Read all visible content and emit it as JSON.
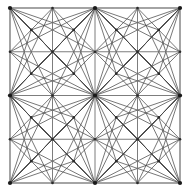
{
  "figure": {
    "type": "mesh-diagram",
    "width": 188,
    "height": 191,
    "background_color": "#ffffff"
  },
  "style": {
    "grid_color": "#6e6e6e",
    "border_color": "#5a5a5a",
    "diagonal_color": "#4a4a4a",
    "node_major_color": "#1a1a1a",
    "node_minor_color": "#2b2b2b",
    "grid_stroke_width": 0.9,
    "border_stroke_width": 1.1,
    "diagonal_stroke_width": 0.75,
    "node_major_radius": 2.1,
    "node_minor_radius": 1.3
  },
  "mesh_data": {
    "domain": {
      "x_min": 10,
      "x_max": 180,
      "y_min": 8,
      "y_max": 183
    },
    "grid_x": [
      10,
      52.5,
      95,
      137.5,
      180
    ],
    "grid_y": [
      8,
      51.75,
      95.5,
      139.25,
      183
    ],
    "quadrant_count": 4,
    "cells_per_side": 4,
    "hub_nodes": [
      {
        "x": 10,
        "y": 8
      },
      {
        "x": 95,
        "y": 8
      },
      {
        "x": 180,
        "y": 8
      },
      {
        "x": 10,
        "y": 95.5
      },
      {
        "x": 95,
        "y": 95.5
      },
      {
        "x": 180,
        "y": 95.5
      },
      {
        "x": 10,
        "y": 183
      },
      {
        "x": 95,
        "y": 183
      },
      {
        "x": 180,
        "y": 183
      }
    ],
    "minor_nodes": [
      {
        "x": 52.5,
        "y": 8
      },
      {
        "x": 137.5,
        "y": 8
      },
      {
        "x": 10,
        "y": 51.75
      },
      {
        "x": 52.5,
        "y": 51.75
      },
      {
        "x": 95,
        "y": 51.75
      },
      {
        "x": 137.5,
        "y": 51.75
      },
      {
        "x": 180,
        "y": 51.75
      },
      {
        "x": 52.5,
        "y": 95.5
      },
      {
        "x": 137.5,
        "y": 95.5
      },
      {
        "x": 10,
        "y": 139.25
      },
      {
        "x": 52.5,
        "y": 139.25
      },
      {
        "x": 95,
        "y": 139.25
      },
      {
        "x": 137.5,
        "y": 139.25
      },
      {
        "x": 180,
        "y": 139.25
      },
      {
        "x": 52.5,
        "y": 183
      },
      {
        "x": 137.5,
        "y": 183
      },
      {
        "x": 31.25,
        "y": 29.875
      },
      {
        "x": 73.75,
        "y": 29.875
      },
      {
        "x": 116.25,
        "y": 29.875
      },
      {
        "x": 158.75,
        "y": 29.875
      },
      {
        "x": 31.25,
        "y": 73.625
      },
      {
        "x": 73.75,
        "y": 73.625
      },
      {
        "x": 116.25,
        "y": 73.625
      },
      {
        "x": 158.75,
        "y": 73.625
      },
      {
        "x": 31.25,
        "y": 117.375
      },
      {
        "x": 73.75,
        "y": 117.375
      },
      {
        "x": 116.25,
        "y": 117.375
      },
      {
        "x": 158.75,
        "y": 117.375
      },
      {
        "x": 31.25,
        "y": 161.125
      },
      {
        "x": 73.75,
        "y": 161.125
      },
      {
        "x": 116.25,
        "y": 161.125
      },
      {
        "x": 158.75,
        "y": 161.125
      }
    ],
    "description": "Square domain subdivided into a 4x4 grid of quadrilateral cells; each cell carries an interior centroid node joined to its four corners, and each of the four quadrants is additionally triangulated by long diagonals fanning from the quadrant corner hub nodes."
  }
}
